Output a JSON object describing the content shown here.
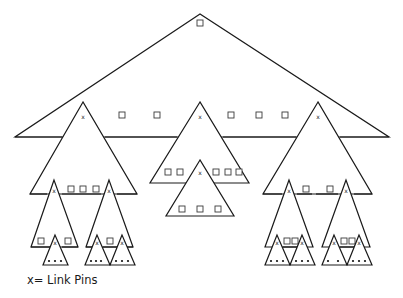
{
  "diagram": {
    "type": "hierarchical-linking-pin-structure",
    "legend": "x= Link Pins",
    "marker_symbol": "x",
    "levels": [
      {
        "level": 1,
        "groups": 1,
        "description": "top organization unit with one member square"
      },
      {
        "level": 2,
        "groups": 3,
        "description": "three units each headed by a link pin (x); squares as members"
      },
      {
        "level": 3,
        "groups": 5,
        "description": "sub-units headed by link pins"
      },
      {
        "level": 4,
        "groups": 7,
        "description": "bottom work groups with dots as members"
      }
    ]
  },
  "colors": {
    "line": "#1a1a1a",
    "background": "#ffffff"
  }
}
